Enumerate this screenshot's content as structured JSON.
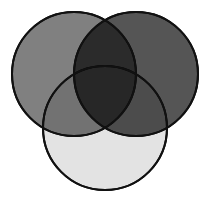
{
  "figure": {
    "title": "Three-circle Venn diagram",
    "type": "venn",
    "width": 209,
    "height": 208,
    "background_color": "#FFFFFF",
    "stroke_color": "#111111",
    "stroke_width": 2,
    "blend_mode": "multiply"
  },
  "chart_data": {
    "type": "venn",
    "title": "Three-circle Venn diagram",
    "set_count": 3,
    "background": "#FFFFFF",
    "sets": [
      {
        "id": "left",
        "label": "A",
        "fill_color": "#808080",
        "stroke_color": "#111111",
        "stroke_width": 2,
        "center_x": 74,
        "center_y": 74,
        "radius": 62
      },
      {
        "id": "right",
        "label": "B",
        "fill_color": "#555555",
        "stroke_color": "#111111",
        "stroke_width": 2,
        "center_x": 136,
        "center_y": 74,
        "radius": 62
      },
      {
        "id": "bottom",
        "label": "C",
        "fill_color": "#E3E3E3",
        "stroke_color": "#111111",
        "stroke_width": 2,
        "center_x": 105,
        "center_y": 128,
        "radius": 62
      }
    ],
    "regions": [
      {
        "id": "left-only",
        "members": "A",
        "observed_color": "#808080"
      },
      {
        "id": "right-only",
        "members": "B",
        "observed_color": "#555555"
      },
      {
        "id": "bottom-only",
        "members": "C",
        "observed_color": "#E3E3E3"
      },
      {
        "id": "left-right",
        "members": "A+B",
        "observed_color": "#2B2B2B"
      },
      {
        "id": "left-bottom",
        "members": "A+C",
        "observed_color": "#717171"
      },
      {
        "id": "right-bottom",
        "members": "B+C",
        "observed_color": "#4A4A4A"
      },
      {
        "id": "all-three",
        "members": "A+B+C",
        "observed_color": "#0D0D0D"
      }
    ]
  }
}
